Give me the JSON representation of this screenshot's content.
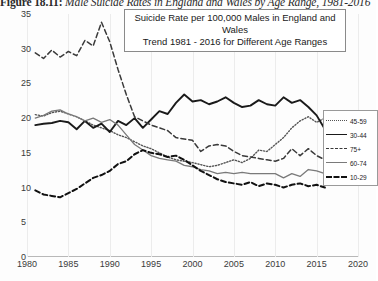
{
  "figure": {
    "caption_label": "Figure 18.11:",
    "caption_text": " Male Suicide Rates in England and Wales by Age Range, 1981-2016"
  },
  "annotation": {
    "line1": "Suicide Rate per 100,000 Males in England and Wales",
    "line2": "Trend 1981 - 2016 for Different Age Ranges"
  },
  "legend": {
    "items": [
      {
        "label": "45-59",
        "style": "dotted",
        "color": "#555555"
      },
      {
        "label": "30-44",
        "style": "solid",
        "color": "#1a1a1a"
      },
      {
        "label": "75+",
        "style": "dashed",
        "color": "#3a3a3a"
      },
      {
        "label": "60-74",
        "style": "solid",
        "color": "#7a7a7a"
      },
      {
        "label": "10-29",
        "style": "dashed",
        "color": "#111111"
      }
    ]
  },
  "chart_data": {
    "type": "line",
    "title": "Suicide Rate per 100,000 Males in England and Wales",
    "subtitle": "Trend 1981 - 2016 for Different Age Ranges",
    "xlabel": "",
    "ylabel": "",
    "xlim": [
      1980,
      2020
    ],
    "ylim": [
      0,
      35
    ],
    "xticks": [
      1980,
      1985,
      1990,
      1995,
      2000,
      2005,
      2010,
      2015,
      2020
    ],
    "yticks": [
      0,
      5,
      10,
      15,
      20,
      25,
      30,
      35
    ],
    "grid": "vertical",
    "legend_position": "right",
    "x": [
      1981,
      1982,
      1983,
      1984,
      1985,
      1986,
      1987,
      1988,
      1989,
      1990,
      1991,
      1992,
      1993,
      1994,
      1995,
      1996,
      1997,
      1998,
      1999,
      2000,
      2001,
      2002,
      2003,
      2004,
      2005,
      2006,
      2007,
      2008,
      2009,
      2010,
      2011,
      2012,
      2013,
      2014,
      2015,
      2016
    ],
    "series": [
      {
        "name": "45-59",
        "style": "dotted",
        "color": "#555555",
        "values": [
          20.5,
          20.3,
          20.8,
          21.0,
          20.6,
          20.2,
          19.6,
          19.0,
          18.6,
          18.2,
          17.6,
          17.2,
          16.6,
          16.0,
          15.6,
          15.0,
          14.4,
          14.0,
          13.8,
          13.6,
          13.3,
          13.0,
          13.2,
          13.6,
          14.0,
          13.6,
          14.2,
          15.4,
          15.2,
          16.2,
          17.2,
          18.6,
          19.6,
          20.2,
          19.4,
          20.0
        ]
      },
      {
        "name": "30-44",
        "style": "solid",
        "color": "#1a1a1a",
        "values": [
          19.0,
          19.2,
          19.3,
          19.6,
          19.4,
          18.4,
          19.6,
          18.6,
          19.2,
          18.0,
          19.6,
          19.0,
          20.0,
          18.6,
          19.8,
          21.0,
          20.6,
          22.2,
          23.4,
          22.4,
          22.6,
          22.0,
          22.4,
          23.0,
          22.2,
          21.6,
          21.8,
          22.6,
          22.0,
          21.8,
          23.0,
          22.2,
          22.6,
          21.6,
          20.4,
          18.4
        ]
      },
      {
        "name": "75+",
        "style": "dashed",
        "color": "#3a3a3a",
        "values": [
          29.4,
          28.6,
          29.8,
          28.8,
          29.6,
          29.0,
          31.2,
          30.4,
          33.8,
          31.0,
          27.0,
          23.4,
          20.2,
          19.6,
          19.0,
          18.6,
          18.2,
          17.2,
          17.0,
          16.8,
          15.2,
          16.0,
          16.2,
          16.0,
          15.2,
          14.6,
          14.4,
          14.2,
          14.0,
          13.8,
          14.2,
          15.6,
          14.6,
          15.6,
          14.6,
          14.0
        ]
      },
      {
        "name": "60-74",
        "style": "solid",
        "color": "#7a7a7a",
        "values": [
          20.0,
          20.4,
          21.0,
          21.2,
          20.6,
          20.2,
          19.6,
          20.0,
          19.4,
          19.8,
          19.0,
          17.6,
          16.2,
          15.4,
          14.6,
          14.2,
          14.0,
          13.8,
          13.2,
          13.0,
          12.6,
          12.4,
          12.0,
          12.2,
          12.0,
          12.2,
          12.0,
          12.0,
          12.0,
          12.0,
          11.4,
          12.0,
          11.6,
          12.6,
          12.4,
          12.0
        ]
      },
      {
        "name": "10-29",
        "style": "dashed",
        "color": "#111111",
        "values": [
          9.6,
          9.0,
          8.8,
          8.6,
          9.2,
          9.8,
          10.6,
          11.4,
          11.8,
          12.4,
          13.4,
          13.8,
          14.8,
          15.4,
          15.0,
          14.8,
          14.4,
          14.6,
          14.0,
          13.2,
          12.4,
          11.8,
          11.2,
          10.8,
          10.6,
          10.4,
          10.8,
          10.2,
          10.6,
          10.4,
          10.0,
          10.4,
          10.6,
          10.2,
          10.4,
          10.0
        ]
      }
    ]
  }
}
